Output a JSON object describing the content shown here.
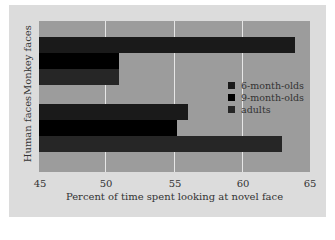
{
  "chart_data": {
    "type": "bar",
    "orientation": "horizontal",
    "title": "",
    "xlabel": "Percent of time spent looking at novel face",
    "ylabel": "",
    "categories": [
      "Monkey faces",
      "Human faces"
    ],
    "series": [
      {
        "name": "6-month-olds",
        "values": [
          63.9,
          56.0
        ],
        "color": "#1a1a1a"
      },
      {
        "name": "9-month-olds",
        "values": [
          50.9,
          55.2
        ],
        "color": "#000000"
      },
      {
        "name": "adults",
        "values": [
          50.9,
          62.9
        ],
        "color": "#262626"
      }
    ],
    "xlim": [
      45,
      65
    ],
    "xticks": [
      "45",
      "50",
      "55",
      "60",
      "65"
    ],
    "grid": true,
    "legend_position": "inside right"
  },
  "legend": {
    "items": [
      {
        "label": "6-month-olds",
        "color": "#1a1a1a"
      },
      {
        "label": "9-month-olds",
        "color": "#000000"
      },
      {
        "label": "adults",
        "color": "#262626"
      }
    ]
  },
  "axis": {
    "xlabel": "Percent of time spent looking at novel face",
    "ticks": [
      "45",
      "50",
      "55",
      "60",
      "65"
    ],
    "categories": [
      "Monkey faces",
      "Human faces"
    ]
  }
}
